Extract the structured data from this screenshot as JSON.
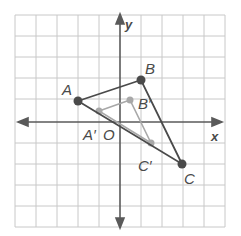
{
  "diagram": {
    "type": "coordinate-plane-dilation",
    "grid": {
      "min": -5,
      "max": 5,
      "unit_px": 21.1,
      "origin_px": [
        120,
        122
      ]
    },
    "axes": {
      "x_label": "x",
      "y_label": "y",
      "origin_label": "O"
    },
    "colors": {
      "grid": "#c8c8c8",
      "axes": "#5a5a5a",
      "original": "#4a4a4a",
      "image": "#a8a8a8",
      "label": "#4a4a4a"
    },
    "original_triangle": {
      "points": [
        {
          "name": "A",
          "label": "A",
          "x": -2,
          "y": 1
        },
        {
          "name": "B",
          "label": "B",
          "x": 1,
          "y": 2
        },
        {
          "name": "C",
          "label": "C",
          "x": 3,
          "y": -2
        }
      ]
    },
    "image_triangle": {
      "points": [
        {
          "name": "A'",
          "label": "A′",
          "x": -1,
          "y": 0.5
        },
        {
          "name": "B'",
          "label": "B′",
          "x": 0.5,
          "y": 1
        },
        {
          "name": "C'",
          "label": "C′",
          "x": 1.5,
          "y": -1
        }
      ]
    },
    "labels": {
      "A": "A",
      "B": "B",
      "C": "C",
      "A_prime": "A′",
      "B_prime": "B′",
      "C_prime": "C′",
      "O": "O",
      "x": "x",
      "y": "y"
    }
  }
}
